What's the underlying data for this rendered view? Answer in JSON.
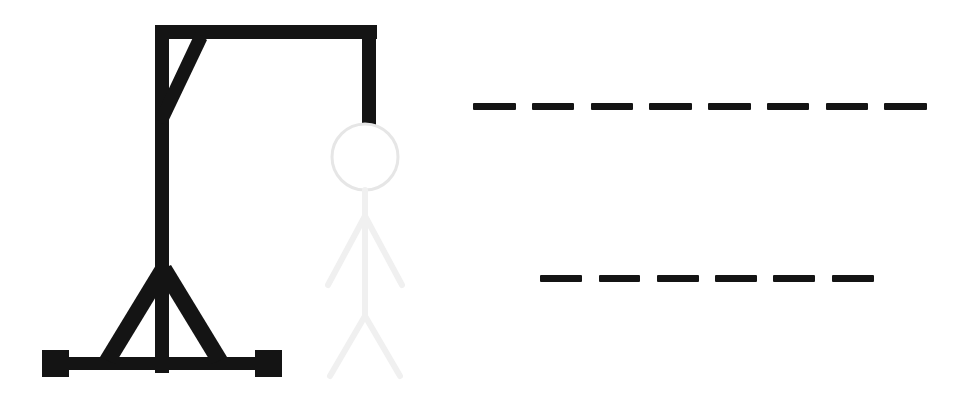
{
  "game": {
    "name": "Hangman",
    "background_color": "#ffffff",
    "ink_color": "#141414",
    "faded_color": "#f0f0f0",
    "head_color": "#e6e6e6"
  },
  "gallows": {
    "label": "Gallows",
    "parts_drawn": [
      "base",
      "post",
      "beam",
      "brace",
      "rope"
    ],
    "color": "#141414"
  },
  "figure": {
    "label": "Hangman Figure",
    "head": {
      "name": "head",
      "state": "faded",
      "color": "#e6e6e6"
    },
    "body": {
      "name": "body",
      "state": "faded",
      "color": "#f0f0f0"
    },
    "left_arm": {
      "name": "left-arm",
      "state": "faded",
      "color": "#f0f0f0"
    },
    "right_arm": {
      "name": "right-arm",
      "state": "faded",
      "color": "#f0f0f0"
    },
    "left_leg": {
      "name": "left-leg",
      "state": "faded",
      "color": "#f0f0f0"
    },
    "right_leg": {
      "name": "right-leg",
      "state": "faded",
      "color": "#f0f0f0"
    }
  },
  "puzzle": {
    "rows": [
      {
        "index": 0,
        "slot_count": 8,
        "letters": [
          "",
          "",
          "",
          "",
          "",
          "",
          "",
          ""
        ]
      },
      {
        "index": 1,
        "slot_count": 6,
        "letters": [
          "",
          "",
          "",
          "",
          "",
          ""
        ]
      }
    ]
  }
}
